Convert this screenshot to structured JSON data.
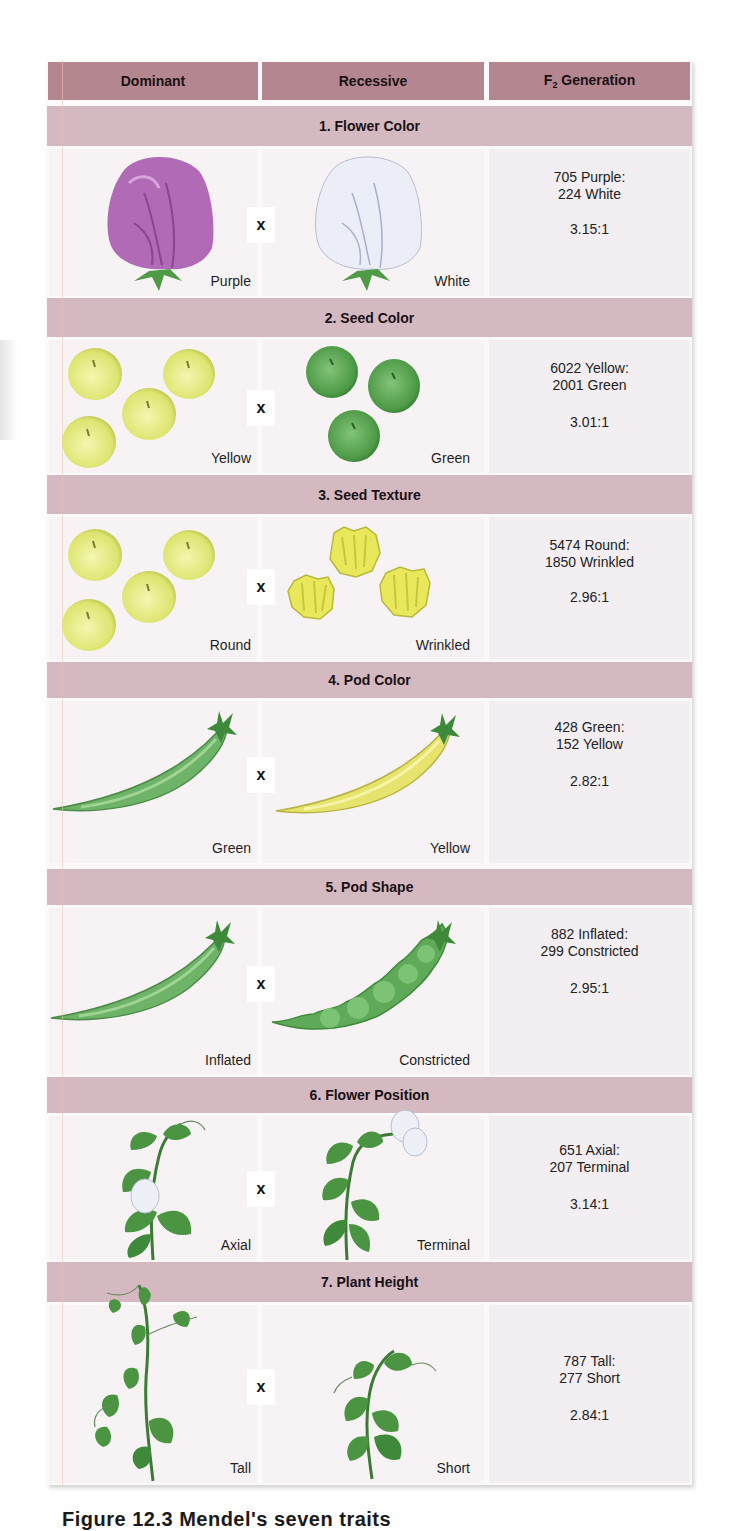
{
  "header": {
    "columns": [
      {
        "label": "Dominant"
      },
      {
        "label": "Recessive"
      },
      {
        "label_main": "F",
        "label_sub": "2",
        "label_rest": " Generation"
      }
    ]
  },
  "colors": {
    "header_bg": "#b48790",
    "section_bg": "#d4b9c0",
    "cell_bg": "#f7f3f5",
    "purple_flower": "#b26bb8",
    "white_flower": "#e8eaf4",
    "yellow_seed": "#e2e87a",
    "green_seed": "#5aa452",
    "green_pod": "#6cb868",
    "yellow_pod": "#e6e46e",
    "leaf_green": "#3e8a3a"
  },
  "cross_symbol": "x",
  "traits": [
    {
      "title": "1. Flower Color",
      "dominant": "Purple",
      "recessive": "White",
      "f2_line1": "705 Purple:",
      "f2_line2": "224 White",
      "ratio": "3.15:1"
    },
    {
      "title": "2. Seed Color",
      "dominant": "Yellow",
      "recessive": "Green",
      "f2_line1": "6022 Yellow:",
      "f2_line2": "2001 Green",
      "ratio": "3.01:1"
    },
    {
      "title": "3. Seed Texture",
      "dominant": "Round",
      "recessive": "Wrinkled",
      "f2_line1": "5474 Round:",
      "f2_line2": "1850 Wrinkled",
      "ratio": "2.96:1"
    },
    {
      "title": "4. Pod Color",
      "dominant": "Green",
      "recessive": "Yellow",
      "f2_line1": "428 Green:",
      "f2_line2": "152 Yellow",
      "ratio": "2.82:1"
    },
    {
      "title": "5. Pod Shape",
      "dominant": "Inflated",
      "recessive": "Constricted",
      "f2_line1": "882 Inflated:",
      "f2_line2": "299 Constricted",
      "ratio": "2.95:1"
    },
    {
      "title": "6. Flower Position",
      "dominant": "Axial",
      "recessive": "Terminal",
      "f2_line1": "651 Axial:",
      "f2_line2": "207 Terminal",
      "ratio": "3.14:1"
    },
    {
      "title": "7. Plant Height",
      "dominant": "Tall",
      "recessive": "Short",
      "f2_line1": "787 Tall:",
      "f2_line2": "277 Short",
      "ratio": "2.84:1"
    }
  ],
  "caption": "Figure 12.3 Mendel's seven traits"
}
